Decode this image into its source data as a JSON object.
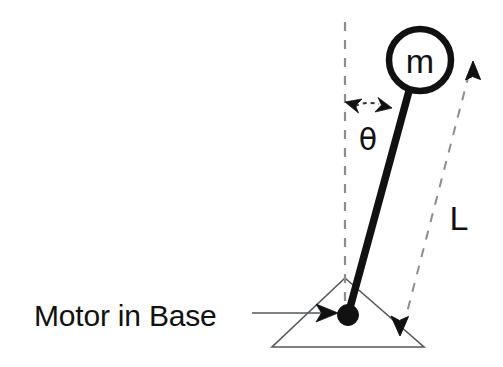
{
  "figure": {
    "kind": "inverted-pendulum-schematic",
    "background_color": "#ffffff",
    "ink_color": "#111111",
    "thin_line_color": "#4a4a4a",
    "dashed_line_color": "#8a8a8a"
  },
  "labels": {
    "mass": "m",
    "angle": "θ",
    "length": "L",
    "caption": "Motor in Base"
  },
  "geometry": {
    "pivot": {
      "x": 348,
      "y": 315,
      "radius": 10
    },
    "mass_circle": {
      "cx": 420,
      "cy": 60,
      "r": 32,
      "stroke_width": 6
    },
    "rod": {
      "x1": 348,
      "y1": 315,
      "x2": 409,
      "y2": 90,
      "stroke_width": 7
    },
    "vertical_dashed": {
      "x": 345,
      "y1": 22,
      "y2": 315
    },
    "length_dimension": {
      "x1": 473,
      "y1": 63,
      "x2": 402,
      "y2": 332
    },
    "base_triangle": {
      "apex_x": 345,
      "apex_y": 278,
      "left_x": 272,
      "left_y": 347,
      "right_x": 424,
      "right_y": 347
    },
    "caption_leader": {
      "x1": 252,
      "y1": 313,
      "x2": 334,
      "y2": 313
    }
  },
  "icons": {
    "angle_arrow": "double-headed-arc-arrow",
    "length_arrow_top": "arrow-up",
    "length_arrow_bottom": "arrow-down",
    "caption_arrow": "arrow-right"
  }
}
